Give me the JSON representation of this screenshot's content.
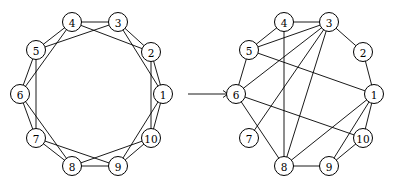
{
  "figure": {
    "arrow_icon": "right-arrow-icon"
  },
  "graphs": [
    {
      "id": "left-graph",
      "node_labels": [
        "1",
        "2",
        "3",
        "4",
        "5",
        "6",
        "7",
        "8",
        "9",
        "10"
      ],
      "edges": [
        [
          1,
          2
        ],
        [
          2,
          3
        ],
        [
          3,
          4
        ],
        [
          4,
          5
        ],
        [
          5,
          6
        ],
        [
          6,
          7
        ],
        [
          7,
          8
        ],
        [
          8,
          9
        ],
        [
          9,
          10
        ],
        [
          10,
          1
        ],
        [
          1,
          3
        ],
        [
          2,
          4
        ],
        [
          3,
          5
        ],
        [
          4,
          6
        ],
        [
          5,
          7
        ],
        [
          6,
          8
        ],
        [
          7,
          9
        ],
        [
          8,
          10
        ],
        [
          9,
          1
        ],
        [
          10,
          2
        ]
      ]
    },
    {
      "id": "right-graph",
      "node_labels": [
        "1",
        "2",
        "3",
        "4",
        "5",
        "6",
        "7",
        "8",
        "9",
        "10"
      ],
      "edges": [
        [
          1,
          2
        ],
        [
          2,
          3
        ],
        [
          3,
          4
        ],
        [
          4,
          5
        ],
        [
          5,
          6
        ],
        [
          8,
          9
        ],
        [
          9,
          10
        ],
        [
          10,
          1
        ],
        [
          5,
          1
        ],
        [
          5,
          3
        ],
        [
          6,
          3
        ],
        [
          6,
          10
        ],
        [
          6,
          8
        ],
        [
          7,
          3
        ],
        [
          4,
          8
        ],
        [
          3,
          8
        ],
        [
          1,
          8
        ],
        [
          1,
          9
        ]
      ]
    }
  ]
}
